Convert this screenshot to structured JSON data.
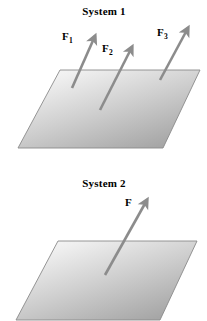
{
  "figure": {
    "background_color": "#ffffff",
    "plane_fill_light": "#f4f4f4",
    "plane_fill_dark": "#a8a8a8",
    "plane_stroke": "#808080",
    "arrow_color": "#8c8c8c",
    "label_color": "#000000"
  },
  "systems": [
    {
      "id": "system-1",
      "title": "System 1",
      "plane": {
        "name": "plane-surface",
        "points": "60,70 200,70 163,148 18,148"
      },
      "forces": [
        {
          "name": "force-arrow-f1",
          "label_base": "F",
          "label_sub": "1",
          "tail_x": 72,
          "tail_y": 88,
          "head_x": 95,
          "head_y": 36
        },
        {
          "name": "force-arrow-f2",
          "label_base": "F",
          "label_sub": "2",
          "tail_x": 100,
          "tail_y": 110,
          "head_x": 132,
          "head_y": 47
        },
        {
          "name": "force-arrow-f3",
          "label_base": "F",
          "label_sub": "3",
          "tail_x": 160,
          "tail_y": 80,
          "head_x": 188,
          "height": 0,
          "head_y": 28
        }
      ]
    },
    {
      "id": "system-2",
      "title": "System 2",
      "plane": {
        "name": "plane-surface",
        "points": "58,81 197,81 160,160 16,160"
      },
      "forces": [
        {
          "name": "force-arrow-f",
          "label_base": "F",
          "label_sub": "",
          "tail_x": 105,
          "tail_y": 115,
          "head_x": 147,
          "head_y": 40
        }
      ]
    }
  ]
}
